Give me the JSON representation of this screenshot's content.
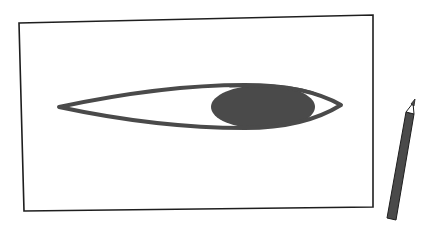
{
  "scene": {
    "description": "Illustration of an eye drawn on a sheet of paper with a pencil beside it",
    "colors": {
      "background": "#ffffff",
      "paper_border": "#1e1e1e",
      "eye_outline": "#4a4a4a",
      "iris": "#4a4a4a",
      "pencil_body": "#4a4a4a",
      "pencil_wood": "#ffffff",
      "pencil_outline": "#1e1e1e"
    },
    "paper": {
      "corners": {
        "top_left": [
          19,
          23
        ],
        "top_right": [
          373,
          15
        ],
        "bottom_right": [
          373,
          207
        ],
        "bottom_left": [
          24,
          211
        ]
      }
    },
    "eye": {
      "left_corner": [
        58,
        107
      ],
      "right_corner": [
        342,
        105
      ],
      "iris_center": [
        264,
        107
      ],
      "iris_radius": [
        52,
        22
      ]
    },
    "pencil": {
      "tip": [
        415,
        99
      ],
      "base": [
        391,
        220
      ]
    }
  }
}
